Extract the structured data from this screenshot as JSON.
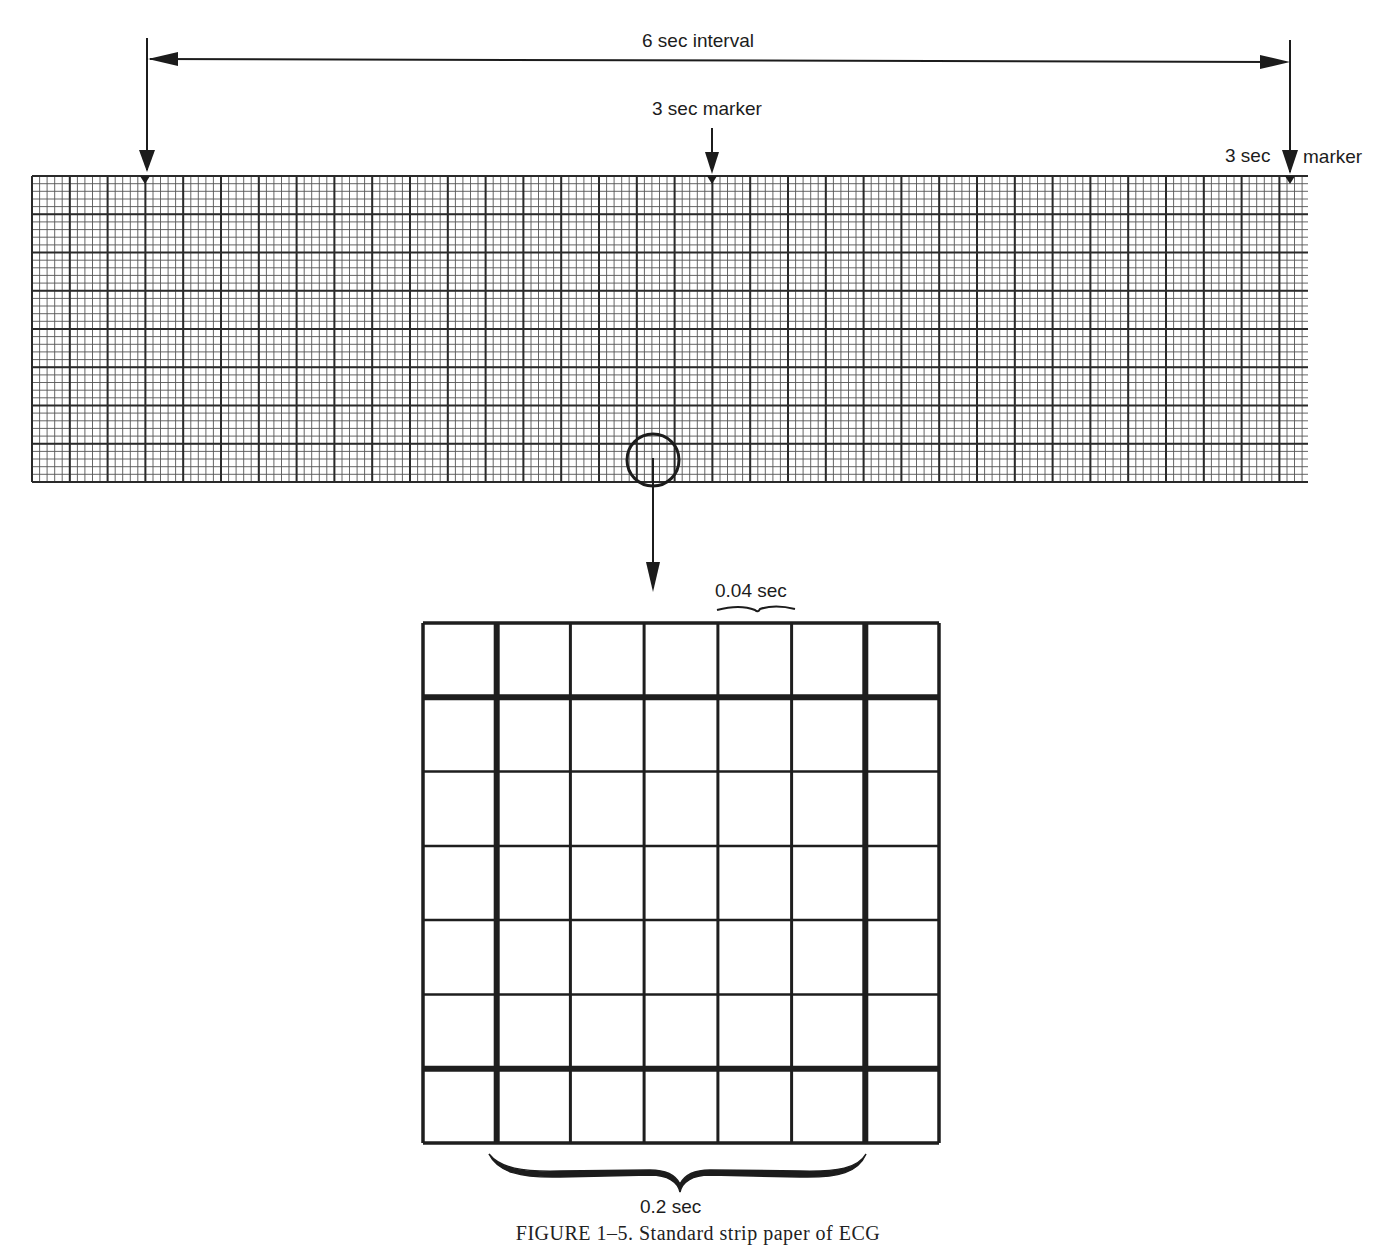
{
  "figure": {
    "caption": "FIGURE 1–5. Standard strip paper of ECG"
  },
  "annotations": {
    "interval_label": "6 sec interval",
    "marker_center_label": "3 sec marker",
    "marker_right_label_a": "3 sec",
    "marker_right_label_b": "marker",
    "small_box_label": "0.04 sec",
    "large_box_label": "0.2 sec"
  },
  "strip": {
    "large_box_px": 37.8,
    "small_per_large": 5,
    "large_rows": 8,
    "large_cols": 34,
    "markers_x": [
      145,
      712,
      1290
    ],
    "line_color": "#2a2a2a"
  },
  "inset": {
    "cols": 7,
    "rows": 7,
    "thick_cols": [
      1,
      6
    ],
    "thick_rows": [
      1,
      6
    ],
    "line_color": "#1e1e1e"
  }
}
